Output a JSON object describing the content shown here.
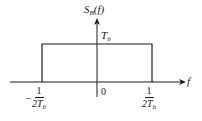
{
  "diagram": {
    "title_label": {
      "main": "S",
      "subscript": "B",
      "arg": "(f)"
    },
    "height_label": {
      "main": "T",
      "subscript": "b"
    },
    "x_axis_label": "f",
    "origin_label": "0",
    "left_tick": {
      "sign": "−",
      "numerator": "1",
      "denominator_main": "2T",
      "denominator_sub": "b"
    },
    "right_tick": {
      "numerator": "1",
      "denominator_main": "2T",
      "denominator_sub": "b"
    },
    "colors": {
      "stroke": "#1a1a1a",
      "background": "#ffffff"
    }
  }
}
